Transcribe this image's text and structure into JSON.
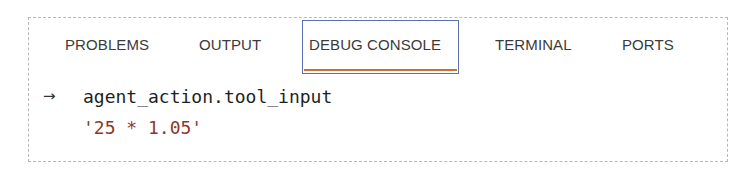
{
  "panel": {
    "tabs": [
      {
        "label": "PROBLEMS",
        "active": false
      },
      {
        "label": "OUTPUT",
        "active": false
      },
      {
        "label": "DEBUG CONSOLE",
        "active": true
      },
      {
        "label": "TERMINAL",
        "active": false
      },
      {
        "label": "PORTS",
        "active": false
      }
    ],
    "active_tab": "DEBUG CONSOLE"
  },
  "console": {
    "prompt_icon": "arrow-right-icon",
    "prompt_glyph": "→",
    "expression": "agent_action.tool_input",
    "result": "'25 * 1.05'"
  },
  "colors": {
    "active_tab_border": "#5b6fb3",
    "active_tab_underline": "#c8703a",
    "string_value": "#8b3a2a",
    "text": "#3b3b3b"
  }
}
